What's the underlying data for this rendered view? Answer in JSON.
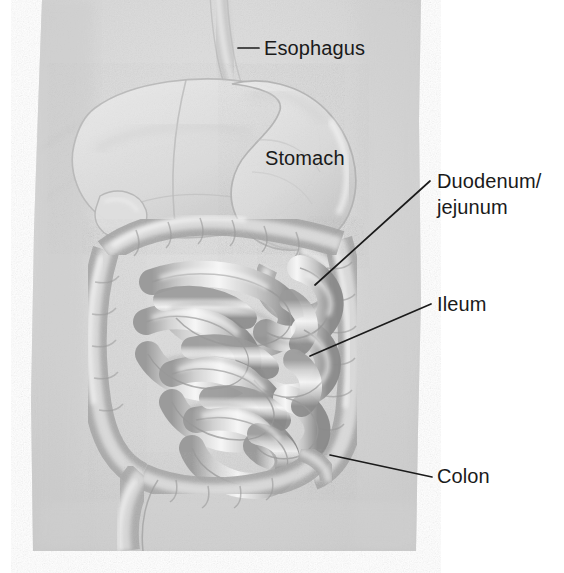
{
  "figure": {
    "type": "anatomical-illustration",
    "style": "grayscale pencil drawing",
    "background_color": "#ffffff",
    "torso_fill_color": "#d7d7d7",
    "line_color": "#1b1b1b",
    "text_color": "#1a1a1a"
  },
  "labels": {
    "esophagus": {
      "text": "Esophagus",
      "x": 264,
      "y": 55
    },
    "stomach": {
      "text": "Stomach",
      "x": 265,
      "y": 165
    },
    "duodenum_line1": {
      "text": "Duodenum/",
      "x": 437,
      "y": 188
    },
    "duodenum_line2": {
      "text": "jejunum",
      "x": 437,
      "y": 214
    },
    "ileum": {
      "text": "Ileum",
      "x": 437,
      "y": 311
    },
    "colon": {
      "text": "Colon",
      "x": 437,
      "y": 483
    }
  },
  "organs": {
    "liver": "liver",
    "stomach": "stomach",
    "duodenum": "duodenum",
    "jejunum": "jejunum",
    "ileum": "ileum",
    "ascending_colon": "ascending-colon",
    "transverse_colon": "transverse-colon",
    "descending_colon": "descending-colon",
    "sigmoid_colon": "sigmoid-colon",
    "cecum": "cecum",
    "esophagus": "esophagus"
  }
}
